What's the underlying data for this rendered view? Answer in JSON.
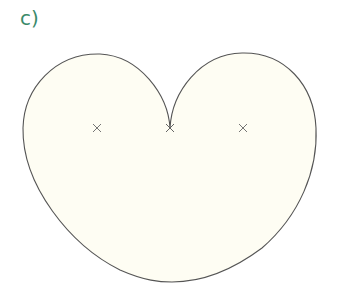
{
  "label": "c)",
  "colors": {
    "label": "#3b8a6a",
    "fill": "#fefdf3",
    "stroke": "#555555",
    "marker": "#666666"
  },
  "figure": {
    "shape": "cardioid-like curve with cusp",
    "markers": [
      {
        "name": "left-focus",
        "symbol": "×",
        "x": 97,
        "y": 128
      },
      {
        "name": "cusp-point",
        "symbol": "×",
        "x": 170,
        "y": 128
      },
      {
        "name": "right-focus",
        "symbol": "×",
        "x": 243,
        "y": 128
      }
    ]
  }
}
